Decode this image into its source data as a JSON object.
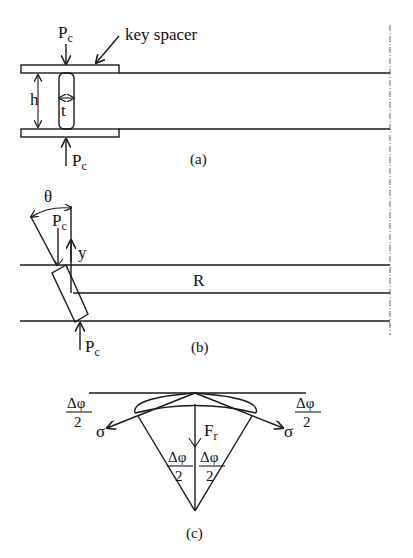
{
  "figure": {
    "panels": [
      {
        "id": "a",
        "caption": "(a)",
        "labels": {
          "force_top": "P",
          "force_top_sub": "c",
          "force_bottom": "P",
          "force_bottom_sub": "c",
          "key_spacer": "key spacer",
          "height": "h",
          "thickness": "t"
        }
      },
      {
        "id": "b",
        "caption": "(b)",
        "labels": {
          "angle": "θ",
          "force_top": "P",
          "force_top_sub": "c",
          "force_bottom": "P",
          "force_bottom_sub": "c",
          "offset": "y",
          "radius": "R"
        }
      },
      {
        "id": "c",
        "caption": "(c)",
        "labels": {
          "left_angle_num": "Δφ",
          "left_angle_den": "2",
          "right_angle_num": "Δφ",
          "right_angle_den": "2",
          "left_stress": "σ",
          "right_stress": "σ",
          "radial_force": "F",
          "radial_force_sub": "r",
          "center_left_num": "Δφ",
          "center_left_den": "2",
          "center_right_num": "Δφ",
          "center_right_den": "2"
        }
      }
    ],
    "colors": {
      "ink": "#1a1a1a",
      "background": "#ffffff",
      "centerline": "#555555"
    }
  }
}
